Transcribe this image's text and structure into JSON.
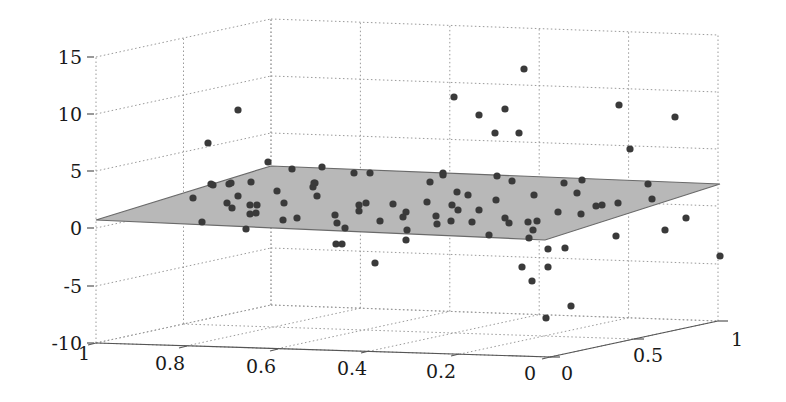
{
  "chart_data": {
    "type": "scatter3d",
    "title": "",
    "xlabel": "",
    "ylabel": "",
    "zlabel": "",
    "x_axis": {
      "ticks": [
        "1",
        "0.8",
        "0.6",
        "0.4",
        "0.2",
        "0"
      ],
      "range": [
        0,
        1
      ]
    },
    "y_axis": {
      "ticks": [
        "0",
        "0.5",
        "1"
      ],
      "range": [
        0,
        1
      ]
    },
    "z_axis": {
      "ticks": [
        "15",
        "10",
        "5",
        "0",
        "-5",
        "-10"
      ],
      "range": [
        -10,
        15
      ]
    },
    "grid": true,
    "legend": null,
    "plane": {
      "color": "#b8b8b8",
      "edge_color": "#6a6a6a",
      "approx_z_at_corners": {
        "x1_y0": 0.5,
        "x1_y1": 4.5,
        "x0_y1": 3.5,
        "x0_y0": -1.5
      }
    },
    "point_color": "#3a3a3a",
    "point_count": 108,
    "points_screen_px": [
      [
        238,
        110
      ],
      [
        208,
        143
      ],
      [
        268,
        162
      ],
      [
        322,
        167
      ],
      [
        354,
        173
      ],
      [
        370,
        173
      ],
      [
        314,
        183
      ],
      [
        313,
        187
      ],
      [
        317,
        196
      ],
      [
        193,
        198
      ],
      [
        211,
        184
      ],
      [
        213,
        185
      ],
      [
        229,
        184
      ],
      [
        231,
        183
      ],
      [
        251,
        182
      ],
      [
        238,
        196
      ],
      [
        227,
        203
      ],
      [
        232,
        208
      ],
      [
        250,
        205
      ],
      [
        257,
        205
      ],
      [
        250,
        214
      ],
      [
        256,
        213
      ],
      [
        202,
        222
      ],
      [
        246,
        229
      ],
      [
        292,
        169
      ],
      [
        277,
        191
      ],
      [
        284,
        203
      ],
      [
        283,
        220
      ],
      [
        297,
        218
      ],
      [
        315,
        183
      ],
      [
        335,
        215
      ],
      [
        337,
        223
      ],
      [
        345,
        228
      ],
      [
        359,
        205
      ],
      [
        359,
        211
      ],
      [
        366,
        203
      ],
      [
        393,
        204
      ],
      [
        406,
        212
      ],
      [
        403,
        217
      ],
      [
        380,
        221
      ],
      [
        407,
        230
      ],
      [
        437,
        224
      ],
      [
        443,
        173
      ],
      [
        430,
        182
      ],
      [
        427,
        202
      ],
      [
        436,
        216
      ],
      [
        336,
        244
      ],
      [
        342,
        244
      ],
      [
        406,
        240
      ],
      [
        375,
        263
      ],
      [
        443,
        175
      ],
      [
        497,
        176
      ],
      [
        512,
        181
      ],
      [
        564,
        183
      ],
      [
        582,
        180
      ],
      [
        457,
        192
      ],
      [
        468,
        195
      ],
      [
        496,
        200
      ],
      [
        534,
        195
      ],
      [
        577,
        193
      ],
      [
        452,
        205
      ],
      [
        458,
        210
      ],
      [
        479,
        210
      ],
      [
        558,
        212
      ],
      [
        581,
        214
      ],
      [
        451,
        221
      ],
      [
        472,
        222
      ],
      [
        505,
        218
      ],
      [
        509,
        223
      ],
      [
        528,
        222
      ],
      [
        537,
        221
      ],
      [
        533,
        230
      ],
      [
        529,
        238
      ],
      [
        489,
        235
      ],
      [
        548,
        249
      ],
      [
        565,
        248
      ],
      [
        522,
        267
      ],
      [
        548,
        267
      ],
      [
        532,
        281
      ],
      [
        571,
        306
      ],
      [
        546,
        318
      ],
      [
        596,
        206
      ],
      [
        602,
        205
      ],
      [
        618,
        203
      ],
      [
        648,
        184
      ],
      [
        652,
        199
      ],
      [
        686,
        218
      ],
      [
        665,
        230
      ],
      [
        616,
        236
      ],
      [
        720,
        256
      ],
      [
        630,
        149
      ],
      [
        524,
        69
      ],
      [
        454,
        97
      ],
      [
        479,
        115
      ],
      [
        505,
        109
      ],
      [
        495,
        133
      ],
      [
        519,
        133
      ],
      [
        619,
        105
      ],
      [
        675,
        117
      ]
    ]
  },
  "geometry": {
    "z_axis_x": 96,
    "z_ticks_y": [
      57,
      114,
      171,
      228,
      286,
      343
    ],
    "floor": {
      "left": [
        96,
        343
      ],
      "back": [
        271,
        305
      ],
      "right": [
        718,
        321
      ],
      "front": [
        550,
        357
      ]
    },
    "ceiling": {
      "left": [
        96,
        57
      ],
      "back": [
        271,
        19
      ],
      "right": [
        720,
        35
      ]
    },
    "plane_poly": [
      [
        96,
        220
      ],
      [
        271,
        166
      ],
      [
        720,
        184
      ],
      [
        545,
        240
      ]
    ],
    "x_tick_positions": [
      [
        96,
        343
      ],
      [
        187,
        346
      ],
      [
        278,
        349
      ],
      [
        369,
        351
      ],
      [
        459,
        354
      ],
      [
        550,
        357
      ]
    ],
    "y_tick_positions": [
      [
        550,
        357
      ],
      [
        634,
        339
      ],
      [
        718,
        321
      ]
    ],
    "x_label_positions": [
      [
        84,
        360
      ],
      [
        170,
        370
      ],
      [
        261,
        373
      ],
      [
        352,
        375
      ],
      [
        441,
        378
      ],
      [
        530,
        380
      ]
    ],
    "y_label_positions": [
      [
        567,
        380
      ],
      [
        648,
        362
      ],
      [
        737,
        346
      ]
    ],
    "z_label_positions": [
      [
        82,
        64
      ],
      [
        82,
        121
      ],
      [
        82,
        178
      ],
      [
        82,
        235
      ],
      [
        82,
        293
      ],
      [
        82,
        350
      ]
    ]
  }
}
